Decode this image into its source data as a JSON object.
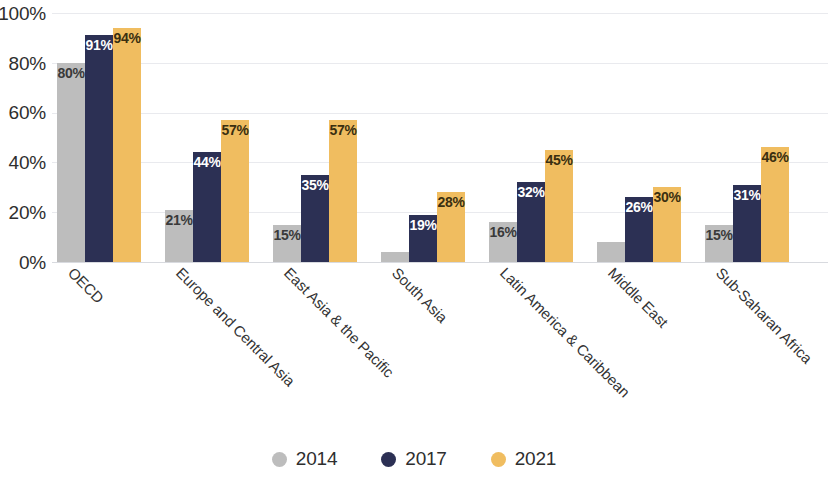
{
  "chart_data": {
    "type": "bar",
    "title": "",
    "subtitle": "",
    "xlabel": "",
    "ylabel": "",
    "ylim": [
      0,
      100
    ],
    "y_ticks": [
      "0%",
      "20%",
      "40%",
      "60%",
      "80%",
      "100%"
    ],
    "y_tick_values": [
      0,
      20,
      40,
      60,
      80,
      100
    ],
    "grid": true,
    "legend_position": "bottom-center",
    "value_suffix": "%",
    "categories": [
      "OECD",
      "Europe and Central Asia",
      "East Asia & the Pacific",
      "South Asia",
      "Latin America & Caribbean",
      "Middle East",
      "Sub-Saharan Africa"
    ],
    "series": [
      {
        "name": "2014",
        "color": "#bdbdbd",
        "values": [
          80,
          21,
          15,
          4,
          16,
          8,
          15
        ],
        "labels": [
          "80%",
          "21%",
          "15%",
          "",
          "16%",
          "",
          "15%"
        ]
      },
      {
        "name": "2017",
        "color": "#2c3054",
        "values": [
          91,
          44,
          35,
          19,
          32,
          26,
          31
        ],
        "labels": [
          "91%",
          "44%",
          "35%",
          "19%",
          "32%",
          "26%",
          "31%"
        ]
      },
      {
        "name": "2021",
        "color": "#f0bd60",
        "values": [
          94,
          57,
          57,
          28,
          45,
          30,
          46
        ],
        "labels": [
          "94%",
          "57%",
          "57%",
          "28%",
          "45%",
          "30%",
          "46%"
        ]
      }
    ]
  },
  "axis": {
    "y_tick_0": "0%",
    "y_tick_1": "20%",
    "y_tick_2": "40%",
    "y_tick_3": "60%",
    "y_tick_4": "80%",
    "y_tick_5": "100%"
  },
  "x_labels": {
    "c0": "OECD",
    "c1": "Europe and Central Asia",
    "c2": "East Asia & the Pacific",
    "c3": "South Asia",
    "c4": "Latin America & Caribbean",
    "c5": "Middle East",
    "c6": "Sub-Saharan Africa"
  },
  "legend": {
    "items": [
      {
        "label": "2014",
        "color": "#bdbdbd"
      },
      {
        "label": "2017",
        "color": "#2c3054"
      },
      {
        "label": "2021",
        "color": "#f0bd60"
      }
    ]
  },
  "bar_values": {
    "g0": {
      "y2014": "80%",
      "y2017": "91%",
      "y2021": "94%"
    },
    "g1": {
      "y2014": "21%",
      "y2017": "44%",
      "y2021": "57%"
    },
    "g2": {
      "y2014": "15%",
      "y2017": "35%",
      "y2021": "57%"
    },
    "g3": {
      "y2014": "",
      "y2017": "19%",
      "y2021": "28%"
    },
    "g4": {
      "y2014": "16%",
      "y2017": "32%",
      "y2021": "45%"
    },
    "g5": {
      "y2014": "",
      "y2017": "26%",
      "y2021": "30%"
    },
    "g6": {
      "y2014": "15%",
      "y2017": "31%",
      "y2021": "46%"
    }
  }
}
